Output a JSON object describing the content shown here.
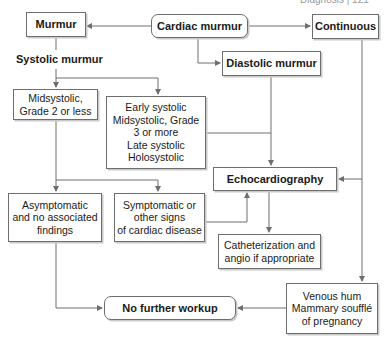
{
  "header": {
    "fragment": "Diagnosis  |  121"
  },
  "diagram": {
    "nodes": {
      "cardiac_murmur": "Cardiac murmur",
      "murmur": "Murmur",
      "continuous": "Continuous",
      "systolic_murmur": "Systolic murmur",
      "diastolic_murmur": "Diastolic murmur",
      "midsystolic_grade2": "Midsystolic,\nGrade 2 or less",
      "early_systolic_group": "Early systolic\nMidsystolic, Grade\n3 or more\nLate systolic\nHolosystolic",
      "echocardiography": "Echocardiography",
      "asymptomatic": "Asymptomatic\nand no associated\nfindings",
      "symptomatic": "Symptomatic or\nother signs\nof cardiac disease",
      "catheterization": "Catheterization and\nangio if appropriate",
      "no_further_workup": "No further workup",
      "venous_hum": "Venous hum\nMammary soufflé\nof pregnancy"
    },
    "edges": [
      [
        "cardiac_murmur",
        "murmur"
      ],
      [
        "cardiac_murmur",
        "continuous"
      ],
      [
        "cardiac_murmur",
        "diastolic_murmur"
      ],
      [
        "murmur",
        "systolic_murmur"
      ],
      [
        "systolic_murmur",
        "midsystolic_grade2"
      ],
      [
        "systolic_murmur",
        "early_systolic_group"
      ],
      [
        "diastolic_murmur",
        "echocardiography"
      ],
      [
        "early_systolic_group",
        "echocardiography"
      ],
      [
        "continuous",
        "echocardiography"
      ],
      [
        "continuous",
        "venous_hum"
      ],
      [
        "midsystolic_grade2",
        "asymptomatic"
      ],
      [
        "midsystolic_grade2",
        "symptomatic"
      ],
      [
        "symptomatic",
        "echocardiography"
      ],
      [
        "echocardiography",
        "catheterization"
      ],
      [
        "asymptomatic",
        "no_further_workup"
      ],
      [
        "venous_hum",
        "no_further_workup"
      ]
    ],
    "colors": {
      "line": "#6e6e6e",
      "box_border": "#6e6e6e",
      "shadow": "#c9c9c9"
    }
  }
}
